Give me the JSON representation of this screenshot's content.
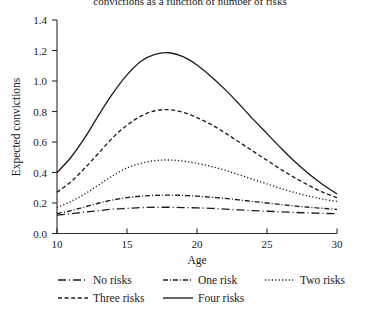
{
  "chart_data": {
    "type": "line",
    "title": "convictions as a function of number of risks",
    "xlabel": "Age",
    "ylabel": "Expected convictions",
    "xlim": [
      10,
      30
    ],
    "ylim": [
      0.0,
      1.4
    ],
    "xticks": [
      10,
      15,
      20,
      25,
      30
    ],
    "yticks": [
      "0.0",
      "0.2",
      "0.4",
      "0.6",
      "0.8",
      "1.0",
      "1.2",
      "1.4"
    ],
    "grid": false,
    "legend_position": "below-axes",
    "x": [
      10,
      11,
      12,
      13,
      14,
      15,
      16,
      17,
      18,
      19,
      20,
      21,
      22,
      23,
      24,
      25,
      26,
      27,
      28,
      29,
      30
    ],
    "series": [
      {
        "name": "No risks",
        "dash": "long-dash",
        "values": [
          0.12,
          0.13,
          0.14,
          0.15,
          0.16,
          0.165,
          0.17,
          0.172,
          0.172,
          0.17,
          0.168,
          0.165,
          0.16,
          0.155,
          0.15,
          0.146,
          0.142,
          0.138,
          0.135,
          0.132,
          0.13
        ]
      },
      {
        "name": "One risk",
        "dash": "dash-dot",
        "values": [
          0.13,
          0.15,
          0.175,
          0.2,
          0.22,
          0.235,
          0.245,
          0.25,
          0.252,
          0.25,
          0.245,
          0.238,
          0.23,
          0.22,
          0.21,
          0.2,
          0.19,
          0.18,
          0.172,
          0.165,
          0.158
        ]
      },
      {
        "name": "Two risks",
        "dash": "dotted",
        "values": [
          0.17,
          0.21,
          0.26,
          0.32,
          0.38,
          0.43,
          0.46,
          0.478,
          0.482,
          0.475,
          0.46,
          0.44,
          0.415,
          0.385,
          0.355,
          0.325,
          0.295,
          0.268,
          0.245,
          0.225,
          0.21
        ]
      },
      {
        "name": "Three risks",
        "dash": "short-dash",
        "values": [
          0.27,
          0.34,
          0.43,
          0.53,
          0.63,
          0.71,
          0.77,
          0.805,
          0.812,
          0.795,
          0.76,
          0.715,
          0.66,
          0.6,
          0.54,
          0.48,
          0.42,
          0.365,
          0.315,
          0.27,
          0.235
        ]
      },
      {
        "name": "Four risks",
        "dash": "solid",
        "values": [
          0.4,
          0.5,
          0.63,
          0.78,
          0.92,
          1.04,
          1.13,
          1.175,
          1.185,
          1.16,
          1.105,
          1.03,
          0.945,
          0.85,
          0.75,
          0.655,
          0.56,
          0.47,
          0.39,
          0.32,
          0.26
        ]
      }
    ]
  },
  "legend": {
    "row1": [
      {
        "label": "No risks",
        "icon": "dash-long-swatch"
      },
      {
        "label": "One risk",
        "icon": "dash-dot-swatch"
      },
      {
        "label": "Two risks",
        "icon": "dotted-swatch"
      }
    ],
    "row2": [
      {
        "label": "Three risks",
        "icon": "dash-short-swatch"
      },
      {
        "label": "Four risks",
        "icon": "solid-swatch"
      }
    ]
  }
}
